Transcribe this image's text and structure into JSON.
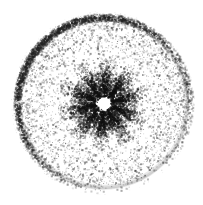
{
  "figure": {
    "kind": "scanned-micrograph",
    "label": "disc-specimen-micrograph",
    "canvas": {
      "width": 203,
      "height": 205
    },
    "background_color": "#ffffff",
    "ink_color": "#1c1c1c",
    "has_text_labels": false,
    "has_axes": false,
    "has_legend": false
  },
  "chart_data": {
    "type": "scatter",
    "title": "",
    "subtitle": "",
    "xlabel": "",
    "ylabel": "",
    "grid": false,
    "legend_position": "none",
    "xlim": [
      0,
      203
    ],
    "ylim": [
      0,
      205
    ],
    "geometry": {
      "center_x": 103,
      "center_y": 103,
      "disc_radius": 89,
      "disc_bounds": {
        "left": 14,
        "right": 191,
        "top": 12,
        "bottom": 193
      },
      "rim_inner_radius": 83,
      "rim_outer_radius": 89,
      "rim_thickness": 6,
      "halo_radius": 33,
      "spike_reach_radius": 45,
      "spike_count": 10,
      "hole_center_x": 104,
      "hole_center_y": 103,
      "hole_radius": 5.5
    },
    "series": [
      {
        "name": "rim-band",
        "role": "dark annular boundary",
        "point_count": 5200,
        "radius_range": [
          82,
          90
        ],
        "color": "#232323",
        "mean_opacity": 0.55,
        "darkest_azimuth_deg": 215,
        "lightest_azimuth_deg": 120
      },
      {
        "name": "interior-field",
        "role": "sparse speckle across disc face",
        "point_count": 4300,
        "radius_range": [
          34,
          84
        ],
        "color": "#2b2b2b",
        "mean_opacity": 0.42,
        "density_gradient": "increases outward"
      },
      {
        "name": "central-halo",
        "role": "dense dark cloud around aperture",
        "point_count": 5400,
        "radius_range": [
          6,
          34
        ],
        "color": "#161616",
        "mean_opacity": 0.6,
        "density_gradient": "decreases outward"
      },
      {
        "name": "radial-spikes",
        "role": "star-shaped streaks radiating from aperture",
        "point_count": 3600,
        "radius_range": [
          7,
          46
        ],
        "color": "#101010",
        "mean_opacity": 0.58,
        "spoke_count": 10,
        "spoke_angular_width_deg": 9
      },
      {
        "name": "outer-fringe",
        "role": "faint stray specks beyond rim",
        "point_count": 220,
        "radius_range": [
          90,
          95
        ],
        "color": "#555555",
        "mean_opacity": 0.22
      }
    ],
    "tone_profile": {
      "radii": [
        0,
        6,
        12,
        20,
        30,
        40,
        55,
        70,
        83,
        89,
        95
      ],
      "mean_gray": [
        255,
        250,
        120,
        150,
        190,
        225,
        243,
        238,
        226,
        90,
        252
      ]
    }
  }
}
